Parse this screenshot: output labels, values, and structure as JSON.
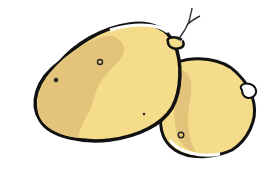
{
  "image": {
    "subject": "Two potatoes illustration",
    "alt": "Hand-drawn illustration of two yellow potatoes with black outlines and a small sprout",
    "colors": {
      "background": "#ffffff",
      "potato_light": "#f5dc8a",
      "potato_shade": "#e3c47a",
      "outline": "#111111",
      "highlight": "#ffffff"
    },
    "potatoes": [
      {
        "name": "large-potato",
        "position": "left"
      },
      {
        "name": "small-potato",
        "position": "right"
      }
    ]
  }
}
